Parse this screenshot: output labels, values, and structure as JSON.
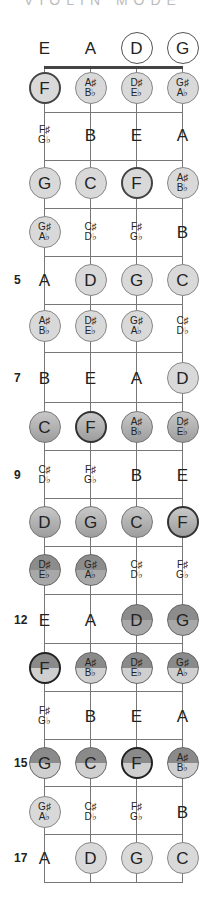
{
  "title": "VIOLIN MODE",
  "strings": [
    "E",
    "A",
    "D",
    "G"
  ],
  "string_x": [
    44,
    90,
    136,
    182
  ],
  "nut_y": 67,
  "fret_y": [
    112,
    160,
    208,
    256,
    304,
    352,
    402,
    450,
    498,
    546,
    594,
    643,
    691,
    739,
    786,
    834,
    882
  ],
  "row_y": [
    48,
    88,
    135,
    183,
    232,
    280,
    326,
    378,
    427,
    475,
    522,
    570,
    620,
    668,
    716,
    763,
    812,
    858
  ],
  "fret_numbers": {
    "5": "5",
    "7": "7",
    "9": "9",
    "12": "12",
    "15": "15",
    "17": "17"
  },
  "rows": [
    [
      [
        "E",
        "",
        "plain"
      ],
      [
        "A",
        "",
        "plain"
      ],
      [
        "D",
        "",
        "open-circle"
      ],
      [
        "G",
        "",
        "open-circle"
      ]
    ],
    [
      [
        "F",
        "",
        "c1 root"
      ],
      [
        "A♯",
        "B♭",
        "c1"
      ],
      [
        "D♯",
        "E♭",
        "c1"
      ],
      [
        "G♯",
        "A♭",
        "c1"
      ]
    ],
    [
      [
        "F♯",
        "G♭",
        "plain"
      ],
      [
        "B",
        "",
        "plain"
      ],
      [
        "E",
        "",
        "plain"
      ],
      [
        "A",
        "",
        "plain"
      ]
    ],
    [
      [
        "G",
        "",
        "c1"
      ],
      [
        "C",
        "",
        "c1"
      ],
      [
        "F",
        "",
        "c1 root"
      ],
      [
        "A♯",
        "B♭",
        "c1"
      ]
    ],
    [
      [
        "G♯",
        "A♭",
        "c1"
      ],
      [
        "C♯",
        "D♭",
        "plain"
      ],
      [
        "F♯",
        "G♭",
        "plain"
      ],
      [
        "B",
        "",
        "plain"
      ]
    ],
    [
      [
        "A",
        "",
        "plain"
      ],
      [
        "D",
        "",
        "c1"
      ],
      [
        "G",
        "",
        "c1"
      ],
      [
        "C",
        "",
        "c1"
      ]
    ],
    [
      [
        "A♯",
        "B♭",
        "c1"
      ],
      [
        "D♯",
        "E♭",
        "c1"
      ],
      [
        "G♯",
        "A♭",
        "c1"
      ],
      [
        "C♯",
        "D♭",
        "plain"
      ]
    ],
    [
      [
        "B",
        "",
        "plain"
      ],
      [
        "E",
        "",
        "plain"
      ],
      [
        "A",
        "",
        "plain"
      ],
      [
        "D",
        "",
        "c1"
      ]
    ],
    [
      [
        "C",
        "",
        "c2"
      ],
      [
        "F",
        "",
        "c2 root"
      ],
      [
        "A♯",
        "B♭",
        "c2"
      ],
      [
        "D♯",
        "E♭",
        "c2"
      ]
    ],
    [
      [
        "C♯",
        "D♭",
        "plain"
      ],
      [
        "F♯",
        "G♭",
        "plain"
      ],
      [
        "B",
        "",
        "plain"
      ],
      [
        "E",
        "",
        "plain"
      ]
    ],
    [
      [
        "D",
        "",
        "c2"
      ],
      [
        "G",
        "",
        "c2"
      ],
      [
        "C",
        "",
        "c2"
      ],
      [
        "F",
        "",
        "c2 root"
      ]
    ],
    [
      [
        "D♯",
        "E♭",
        "c3"
      ],
      [
        "G♯",
        "A♭",
        "c3"
      ],
      [
        "C♯",
        "D♭",
        "plain"
      ],
      [
        "F♯",
        "G♭",
        "plain"
      ]
    ],
    [
      [
        "E",
        "",
        "plain"
      ],
      [
        "A",
        "",
        "plain"
      ],
      [
        "D",
        "",
        "c3"
      ],
      [
        "G",
        "",
        "c3"
      ]
    ],
    [
      [
        "F",
        "",
        "c4 root"
      ],
      [
        "A♯",
        "B♭",
        "c4"
      ],
      [
        "D♯",
        "E♭",
        "c4"
      ],
      [
        "G♯",
        "A♭",
        "c4"
      ]
    ],
    [
      [
        "F♯",
        "G♭",
        "plain"
      ],
      [
        "B",
        "",
        "plain"
      ],
      [
        "E",
        "",
        "plain"
      ],
      [
        "A",
        "",
        "plain"
      ]
    ],
    [
      [
        "G",
        "",
        "c4"
      ],
      [
        "C",
        "",
        "c4"
      ],
      [
        "F",
        "",
        "c4 root"
      ],
      [
        "A♯",
        "B♭",
        "c4"
      ]
    ],
    [
      [
        "G♯",
        "A♭",
        "c1"
      ],
      [
        "C♯",
        "D♭",
        "plain"
      ],
      [
        "F♯",
        "G♭",
        "plain"
      ],
      [
        "B",
        "",
        "plain"
      ]
    ],
    [
      [
        "A",
        "",
        "plain"
      ],
      [
        "D",
        "",
        "c1"
      ],
      [
        "G",
        "",
        "c1"
      ],
      [
        "C",
        "",
        "c1"
      ]
    ]
  ]
}
